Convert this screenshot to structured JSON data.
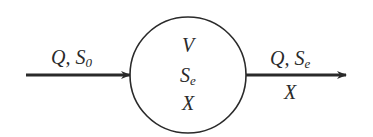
{
  "diagram": {
    "type": "reactor-mass-balance",
    "colors": {
      "stroke": "#2a2a2a",
      "background": "#ffffff"
    },
    "inflow": {
      "label_main": "Q, S",
      "label_sub": "0"
    },
    "reactor": {
      "line1": "V",
      "line2_main": "S",
      "line2_sub": "e",
      "line3": "X"
    },
    "outflow": {
      "label_main": "Q, S",
      "label_sub": "e",
      "label_below": "X"
    }
  }
}
